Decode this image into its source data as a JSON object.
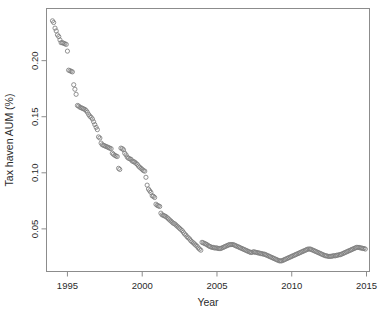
{
  "chart_data": {
    "type": "scatter",
    "title": "",
    "xlabel": "Year",
    "ylabel": "Tax haven AUM (%)",
    "xlim": [
      1993.6,
      2015.2
    ],
    "ylim": [
      0.012,
      0.2465
    ],
    "xticks": [
      1995,
      2000,
      2005,
      2010,
      2015
    ],
    "xticklabels": [
      "1995",
      "2000",
      "2005",
      "2010",
      "2015"
    ],
    "yticks": [
      0.05,
      0.1,
      0.15,
      0.2
    ],
    "yticklabels": [
      "0.05",
      "0.10",
      "0.15",
      "0.20"
    ],
    "grid": false,
    "legend": null,
    "marker": "open-circle",
    "marker_color": "#7d7d7d",
    "marker_size": 2.1,
    "frame_color": "#8c8c8c",
    "series": [
      {
        "name": "Tax haven AUM (%)",
        "x": [
          1994.0,
          1994.08,
          1994.17,
          1994.25,
          1994.33,
          1994.42,
          1994.5,
          1994.58,
          1994.67,
          1994.75,
          1994.83,
          1994.92,
          1995.0,
          1995.08,
          1995.17,
          1995.25,
          1995.33,
          1995.42,
          1995.5,
          1995.58,
          1995.67,
          1995.75,
          1995.83,
          1995.92,
          1996.0,
          1996.08,
          1996.17,
          1996.25,
          1996.33,
          1996.42,
          1996.5,
          1996.58,
          1996.67,
          1996.75,
          1996.83,
          1996.92,
          1997.0,
          1997.08,
          1997.17,
          1997.25,
          1997.33,
          1997.42,
          1997.5,
          1997.58,
          1997.67,
          1997.75,
          1997.83,
          1997.92,
          1998.0,
          1998.08,
          1998.17,
          1998.25,
          1998.33,
          1998.42,
          1998.5,
          1998.58,
          1998.67,
          1998.75,
          1998.83,
          1998.92,
          1999.0,
          1999.08,
          1999.17,
          1999.25,
          1999.33,
          1999.42,
          1999.5,
          1999.58,
          1999.67,
          1999.75,
          1999.83,
          1999.92,
          2000.0,
          2000.08,
          2000.17,
          2000.25,
          2000.33,
          2000.42,
          2000.5,
          2000.58,
          2000.67,
          2000.75,
          2000.83,
          2000.92,
          2001.0,
          2001.08,
          2001.17,
          2001.25,
          2001.33,
          2001.42,
          2001.5,
          2001.58,
          2001.67,
          2001.75,
          2001.83,
          2001.92,
          2002.0,
          2002.08,
          2002.17,
          2002.25,
          2002.33,
          2002.42,
          2002.5,
          2002.58,
          2002.67,
          2002.75,
          2002.83,
          2002.92,
          2003.0,
          2003.08,
          2003.17,
          2003.25,
          2003.33,
          2003.42,
          2003.5,
          2003.58,
          2003.67,
          2003.75,
          2003.83,
          2003.92,
          2004.0,
          2004.08,
          2004.17,
          2004.25,
          2004.33,
          2004.42,
          2004.5,
          2004.58,
          2004.67,
          2004.75,
          2004.83,
          2004.92,
          2005.0,
          2005.08,
          2005.17,
          2005.25,
          2005.33,
          2005.42,
          2005.5,
          2005.58,
          2005.67,
          2005.75,
          2005.83,
          2005.92,
          2006.0,
          2006.08,
          2006.17,
          2006.25,
          2006.33,
          2006.42,
          2006.5,
          2006.58,
          2006.67,
          2006.75,
          2006.83,
          2006.92,
          2007.0,
          2007.08,
          2007.17,
          2007.25,
          2007.33,
          2007.42,
          2007.5,
          2007.58,
          2007.67,
          2007.75,
          2007.83,
          2007.92,
          2008.0,
          2008.08,
          2008.17,
          2008.25,
          2008.33,
          2008.42,
          2008.5,
          2008.58,
          2008.67,
          2008.75,
          2008.83,
          2008.92,
          2009.0,
          2009.08,
          2009.17,
          2009.25,
          2009.33,
          2009.42,
          2009.5,
          2009.58,
          2009.67,
          2009.75,
          2009.83,
          2009.92,
          2010.0,
          2010.08,
          2010.17,
          2010.25,
          2010.33,
          2010.42,
          2010.5,
          2010.58,
          2010.67,
          2010.75,
          2010.83,
          2010.92,
          2011.0,
          2011.08,
          2011.17,
          2011.25,
          2011.33,
          2011.42,
          2011.5,
          2011.58,
          2011.67,
          2011.75,
          2011.83,
          2011.92,
          2012.0,
          2012.08,
          2012.17,
          2012.25,
          2012.33,
          2012.42,
          2012.5,
          2012.58,
          2012.67,
          2012.75,
          2012.83,
          2012.92,
          2013.0,
          2013.08,
          2013.17,
          2013.25,
          2013.33,
          2013.42,
          2013.5,
          2013.58,
          2013.67,
          2013.75,
          2013.83,
          2013.92,
          2014.0,
          2014.08,
          2014.17,
          2014.25,
          2014.33,
          2014.42,
          2014.5,
          2014.58,
          2014.67,
          2014.75,
          2014.83,
          2014.92
        ],
        "y": [
          0.2355,
          0.234,
          0.229,
          0.2265,
          0.223,
          0.2215,
          0.2185,
          0.216,
          0.216,
          0.2155,
          0.215,
          0.2145,
          0.2085,
          0.1915,
          0.191,
          0.1905,
          0.19,
          0.1785,
          0.1745,
          0.17,
          0.16,
          0.1595,
          0.1585,
          0.158,
          0.1575,
          0.157,
          0.1565,
          0.1555,
          0.154,
          0.152,
          0.1505,
          0.1495,
          0.148,
          0.1455,
          0.143,
          0.1405,
          0.1385,
          0.132,
          0.131,
          0.1265,
          0.125,
          0.1245,
          0.124,
          0.1235,
          0.123,
          0.1225,
          0.122,
          0.1215,
          0.1175,
          0.1165,
          0.1155,
          0.115,
          0.1145,
          0.104,
          0.103,
          0.122,
          0.1215,
          0.1205,
          0.1175,
          0.116,
          0.114,
          0.113,
          0.1125,
          0.112,
          0.1105,
          0.11,
          0.1095,
          0.1085,
          0.1075,
          0.106,
          0.105,
          0.104,
          0.103,
          0.102,
          0.1015,
          0.096,
          0.089,
          0.0855,
          0.084,
          0.0825,
          0.0795,
          0.079,
          0.078,
          0.072,
          0.071,
          0.0705,
          0.07,
          0.064,
          0.0625,
          0.062,
          0.0615,
          0.061,
          0.06,
          0.059,
          0.058,
          0.057,
          0.056,
          0.055,
          0.0545,
          0.0535,
          0.0525,
          0.0515,
          0.0505,
          0.0495,
          0.0485,
          0.047,
          0.0455,
          0.0445,
          0.043,
          0.042,
          0.041,
          0.0395,
          0.0385,
          0.0375,
          0.0365,
          0.0355,
          0.0345,
          0.033,
          0.032,
          0.031,
          0.038,
          0.0375,
          0.037,
          0.0365,
          0.036,
          0.035,
          0.0345,
          0.034,
          0.0335,
          0.0335,
          0.033,
          0.033,
          0.033,
          0.0325,
          0.0325,
          0.0325,
          0.033,
          0.0335,
          0.034,
          0.0345,
          0.035,
          0.0355,
          0.036,
          0.036,
          0.036,
          0.036,
          0.0355,
          0.035,
          0.0345,
          0.034,
          0.0335,
          0.033,
          0.0325,
          0.032,
          0.0315,
          0.031,
          0.0305,
          0.03,
          0.0295,
          0.029,
          0.029,
          0.0295,
          0.0295,
          0.029,
          0.029,
          0.0285,
          0.0285,
          0.028,
          0.028,
          0.0275,
          0.0275,
          0.027,
          0.0265,
          0.026,
          0.0255,
          0.025,
          0.0245,
          0.024,
          0.0235,
          0.023,
          0.0225,
          0.022,
          0.0215,
          0.0215,
          0.0215,
          0.022,
          0.0225,
          0.023,
          0.0235,
          0.024,
          0.0245,
          0.025,
          0.0255,
          0.026,
          0.0265,
          0.027,
          0.0275,
          0.028,
          0.0285,
          0.029,
          0.0295,
          0.03,
          0.0305,
          0.031,
          0.0315,
          0.032,
          0.032,
          0.032,
          0.0315,
          0.031,
          0.0305,
          0.03,
          0.0295,
          0.029,
          0.0285,
          0.028,
          0.0275,
          0.027,
          0.0265,
          0.026,
          0.026,
          0.0255,
          0.0255,
          0.0255,
          0.0255,
          0.026,
          0.026,
          0.026,
          0.0265,
          0.0265,
          0.027,
          0.027,
          0.0275,
          0.028,
          0.0285,
          0.029,
          0.0295,
          0.03,
          0.0305,
          0.031,
          0.0315,
          0.032,
          0.0325,
          0.033,
          0.0335,
          0.0335,
          0.0335,
          0.033,
          0.033,
          0.0325,
          0.0325,
          0.032
        ]
      }
    ]
  }
}
